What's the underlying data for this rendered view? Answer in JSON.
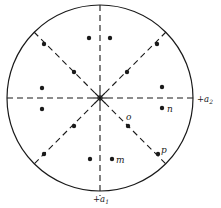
{
  "diagram": {
    "type": "stereographic-projection",
    "center": [
      100,
      98
    ],
    "radius": 93,
    "axes": {
      "a1": {
        "label": "+a",
        "sub": "1",
        "direction": "down"
      },
      "a2": {
        "label": "+a",
        "sub": "2",
        "direction": "right"
      }
    },
    "mirror_lines": [
      "vertical",
      "horizontal",
      "diagonal-45",
      "diagonal-135"
    ],
    "points": [
      {
        "x": 44,
        "y": 44,
        "label": ""
      },
      {
        "x": 89,
        "y": 38,
        "label": ""
      },
      {
        "x": 110,
        "y": 38,
        "label": ""
      },
      {
        "x": 157,
        "y": 44,
        "label": ""
      },
      {
        "x": 74,
        "y": 72,
        "label": ""
      },
      {
        "x": 127,
        "y": 72,
        "label": ""
      },
      {
        "x": 42,
        "y": 88,
        "label": ""
      },
      {
        "x": 162,
        "y": 87,
        "label": ""
      },
      {
        "x": 42,
        "y": 109,
        "label": ""
      },
      {
        "x": 162,
        "y": 108,
        "label": "n"
      },
      {
        "x": 74,
        "y": 126,
        "label": ""
      },
      {
        "x": 128,
        "y": 126,
        "label": "o"
      },
      {
        "x": 44,
        "y": 154,
        "label": ""
      },
      {
        "x": 158,
        "y": 154,
        "label": "p"
      },
      {
        "x": 90,
        "y": 159,
        "label": ""
      },
      {
        "x": 112,
        "y": 159,
        "label": "m"
      }
    ],
    "labels": {
      "n": "n",
      "o": "o",
      "p": "p",
      "m": "m",
      "a1_main": "+a",
      "a1_sub": "1",
      "a2_main": "+a",
      "a2_sub": "2"
    }
  }
}
